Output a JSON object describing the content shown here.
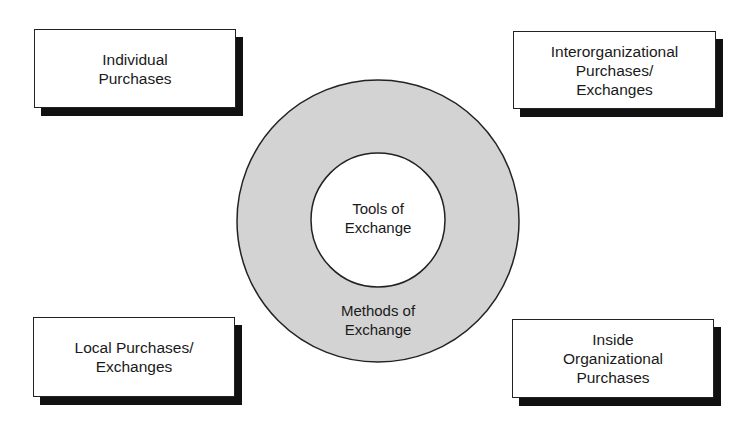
{
  "diagram": {
    "boxes": [
      {
        "id": "top-left",
        "lines": [
          "Individual",
          "Purchases"
        ]
      },
      {
        "id": "top-right",
        "lines": [
          "Interorganizational",
          "Purchases/",
          "Exchanges"
        ]
      },
      {
        "id": "bottom-left",
        "lines": [
          "Local Purchases/",
          "Exchanges"
        ]
      },
      {
        "id": "bottom-right",
        "lines": [
          "Inside",
          "Organizational",
          "Purchases"
        ]
      }
    ],
    "circle": {
      "inner": {
        "lines": [
          "Tools of",
          "Exchange"
        ]
      },
      "outer": {
        "lines": [
          "Methods of",
          "Exchange"
        ]
      },
      "ring_color": "#d3d3d3",
      "inner_color": "#ffffff"
    }
  }
}
